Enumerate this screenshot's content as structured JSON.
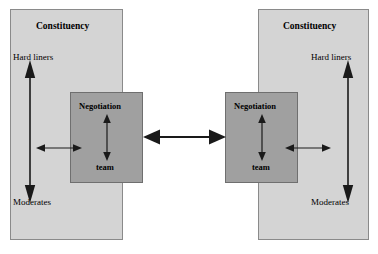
{
  "diagram": {
    "background_color": "#ffffff",
    "constituency_fill": "#d4d4d4",
    "constituency_stroke": "#8a8a8a",
    "negotiation_fill": "#a0a0a0",
    "negotiation_stroke": "#6f6f6f",
    "arrow_color": "#1a1a1a"
  },
  "left": {
    "constituency_title": "Constituency",
    "top_label": "Hard liners",
    "bottom_label": "Moderates",
    "negotiation_title": "Negotiation",
    "negotiation_subtitle": "team"
  },
  "right": {
    "constituency_title": "Constituency",
    "top_label": "Hard liners",
    "bottom_label": "Moderates",
    "negotiation_title": "Negotiation",
    "negotiation_subtitle": "team"
  },
  "connectors": {
    "center_link": "double-headed-arrow",
    "left_internal_vertical": "double-headed-arrow",
    "right_internal_vertical": "double-headed-arrow",
    "left_constituency_axis": "double-headed-arrow",
    "right_constituency_axis": "double-headed-arrow",
    "left_link": "double-headed-arrow",
    "right_link": "double-headed-arrow"
  }
}
